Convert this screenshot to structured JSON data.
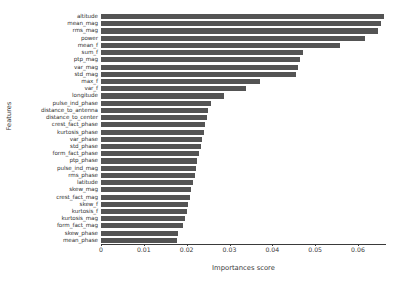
{
  "chart_data": {
    "type": "bar",
    "orientation": "horizontal",
    "title": "",
    "xlabel": "Importances score",
    "ylabel": "Features",
    "xlim": [
      0,
      0.0665
    ],
    "ylim": [
      0,
      30
    ],
    "grid": false,
    "legend": null,
    "bar_color": "#545454",
    "xticks": [
      0,
      0.01,
      0.02,
      0.03,
      0.04,
      0.05,
      0.06
    ],
    "xtick_labels": [
      "0",
      "0.01",
      "0.02",
      "0.03",
      "0.04",
      "0.05",
      "0.06"
    ],
    "categories": [
      "altitude",
      "mean_mag",
      "rms_mag",
      "power",
      "mean_f",
      "sum_f",
      "ptp_mag",
      "var_mag",
      "std_mag",
      "max_f",
      "var_f",
      "longitude",
      "pulse_ind_phase",
      "distance_to_antenna",
      "distance_to_center",
      "crest_fact_phase",
      "kurtosis_phase",
      "var_phase",
      "std_phase",
      "form_fact_phase",
      "ptp_phase",
      "pulse_ind_mag",
      "rms_phase",
      "latitude",
      "skew_mag",
      "crest_fact_mag",
      "skew_f",
      "kurtosis_f",
      "kurtosis_mag",
      "form_fact_mag",
      "skew_phase",
      "mean_phase"
    ],
    "values": [
      0.0661,
      0.0654,
      0.0647,
      0.0617,
      0.0558,
      0.0472,
      0.0465,
      0.0459,
      0.0455,
      0.0371,
      0.0338,
      0.0287,
      0.0257,
      0.025,
      0.0247,
      0.0243,
      0.024,
      0.0236,
      0.0233,
      0.0228,
      0.0224,
      0.0221,
      0.0219,
      0.0215,
      0.0211,
      0.0207,
      0.0204,
      0.0201,
      0.0197,
      0.0192,
      0.018,
      0.0177
    ]
  }
}
